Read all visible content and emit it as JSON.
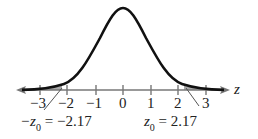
{
  "figure": {
    "type": "normal-distribution-curve",
    "axis_variable": "z",
    "tick_labels": [
      "−3",
      "−2",
      "−1",
      "0",
      "1",
      "2",
      "3"
    ],
    "ticks": [
      -3,
      -2,
      -1,
      0,
      1,
      2,
      3
    ],
    "critical_values": {
      "left": {
        "symbol": "−z",
        "subscript": "0",
        "eq": " = −2.17",
        "value": -2.17
      },
      "right": {
        "symbol": "z",
        "subscript": "0",
        "eq": " = 2.17",
        "value": 2.17
      }
    },
    "shaded_regions": "both tails beyond ±2.17",
    "colors": {
      "curve": "#111111",
      "axis": "#777777",
      "shade": "#aaaaaa",
      "text": "#222222"
    }
  }
}
